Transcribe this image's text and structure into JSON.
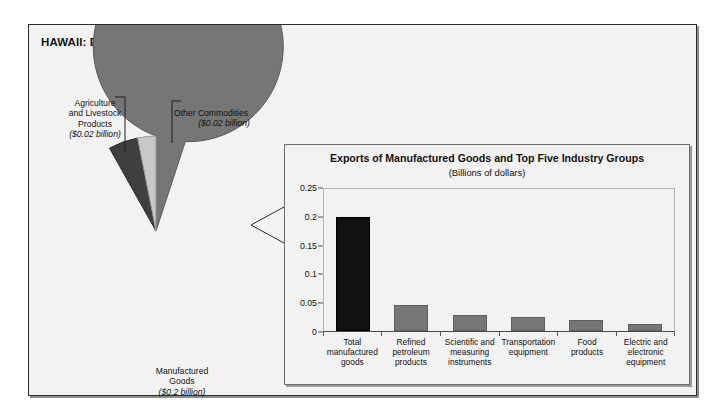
{
  "figure": {
    "title": "HAWAII: Exports of Goods, 1999"
  },
  "pie": {
    "type": "pie",
    "labels": [
      {
        "name": "Agriculture and Livestock Products",
        "text": "Agriculture\nand Livestock\nProducts",
        "amount": "($0.02 billion)",
        "value": 0.02,
        "color": "#3f3f3f"
      },
      {
        "name": "Other Commodities",
        "text": "Other Commodities",
        "amount": "($0.02 billion)",
        "value": 0.02,
        "color": "#c3c3c3"
      },
      {
        "name": "Manufactured Goods",
        "text": "Manufactured\nGoods",
        "amount": "($0.2 billion)",
        "value": 0.2,
        "color": "#767676"
      }
    ]
  },
  "bar_panel": {
    "title": "Exports of Manufactured Goods and Top Five Industry Groups",
    "subtitle": "(Billions of dollars)"
  },
  "chart_data": {
    "type": "bar",
    "title": "Exports of Manufactured Goods and Top Five Industry Groups",
    "subtitle": "(Billions of dollars)",
    "xlabel": "",
    "ylabel": "",
    "ylim": [
      0,
      0.25
    ],
    "yticks": [
      "0",
      "0.05",
      "0.1",
      "0.15",
      "0.2",
      "0.25"
    ],
    "ytick_values": [
      0,
      0.05,
      0.1,
      0.15,
      0.2,
      0.25
    ],
    "grid": false,
    "legend": "none",
    "categories": [
      "Total\nmanufactured\ngoods",
      "Refined\npetroleum\nproducts",
      "Scientific and\nmeasuring\ninstruments",
      "Transportation\nequipment",
      "Food\nproducts",
      "Electric and\nelectronic\nequipment"
    ],
    "values": [
      0.2,
      0.045,
      0.028,
      0.024,
      0.02,
      0.012
    ],
    "bar_colors": [
      "#111111",
      "#767676",
      "#767676",
      "#767676",
      "#767676",
      "#767676"
    ]
  }
}
